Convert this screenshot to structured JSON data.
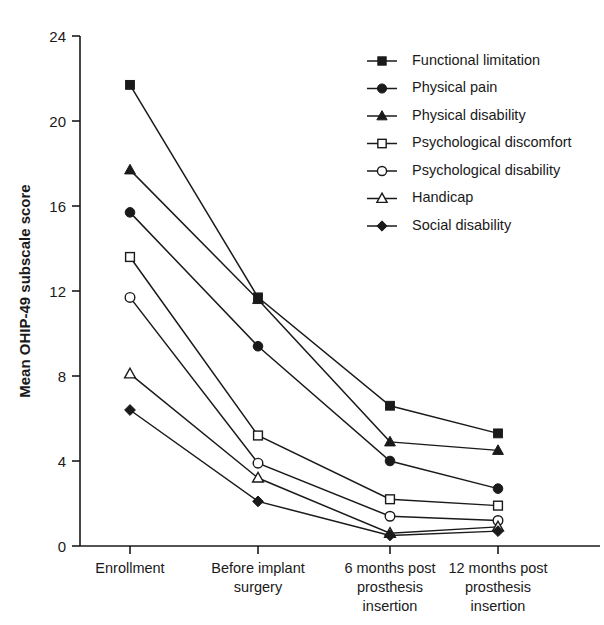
{
  "chart_data": {
    "type": "line",
    "title": "",
    "subtitle": "",
    "xlabel": "",
    "ylabel": "Mean OHIP-49 subscale score",
    "categories": [
      "Enrollment",
      "Before implant surgery",
      "6 months post prosthesis insertion",
      "12 months post prosthesis insertion"
    ],
    "category_lines": [
      [
        "Enrollment"
      ],
      [
        "Before implant",
        "surgery"
      ],
      [
        "6 months post",
        "prosthesis",
        "insertion"
      ],
      [
        "12 months post",
        "prosthesis",
        "insertion"
      ]
    ],
    "ylim": [
      0,
      24
    ],
    "yticks": [
      0,
      4,
      8,
      12,
      16,
      20,
      24
    ],
    "ytick_labels": [
      "0",
      "4",
      "8",
      "12",
      "16",
      "20",
      "24"
    ],
    "grid": false,
    "legend_position": "top-right",
    "series": [
      {
        "name": "Functional limitation",
        "marker": "filled-square",
        "values": [
          21.7,
          11.7,
          6.6,
          5.3
        ]
      },
      {
        "name": "Physical pain",
        "marker": "filled-circle",
        "values": [
          15.7,
          9.4,
          4.0,
          2.7
        ]
      },
      {
        "name": "Physical disability",
        "marker": "filled-triangle",
        "values": [
          17.7,
          11.6,
          4.9,
          4.5
        ]
      },
      {
        "name": "Psychological discomfort",
        "marker": "open-square",
        "values": [
          13.6,
          5.2,
          2.2,
          1.9
        ]
      },
      {
        "name": "Psychological disability",
        "marker": "open-circle",
        "values": [
          11.7,
          3.9,
          1.4,
          1.2
        ]
      },
      {
        "name": "Handicap",
        "marker": "open-triangle",
        "values": [
          8.1,
          3.2,
          0.6,
          0.9
        ]
      },
      {
        "name": "Social disability",
        "marker": "filled-diamond",
        "values": [
          6.4,
          2.1,
          0.5,
          0.7
        ]
      }
    ]
  },
  "legend": {
    "entries": [
      "Functional limitation",
      "Physical pain",
      "Physical disability",
      "Psychological discomfort",
      "Psychological disability",
      "Handicap",
      "Social disability"
    ]
  },
  "colors": {
    "ink": "#1a1a1a",
    "background": "#ffffff"
  }
}
